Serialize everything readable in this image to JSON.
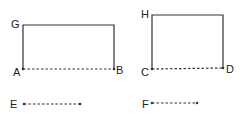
{
  "diagram": {
    "colors": {
      "line": "#333333",
      "label": "#222222",
      "background": "#ffffff"
    },
    "left_figure": {
      "labels": {
        "top_left": "G",
        "bottom_left": "A",
        "bottom_right": "B"
      },
      "solid_edges": [
        "G-top-right",
        "G-A",
        "top-right-B"
      ],
      "dashed_edges": [
        "A-B"
      ]
    },
    "right_figure": {
      "labels": {
        "top_left": "H",
        "bottom_left": "C",
        "bottom_right": "D"
      },
      "solid_edges": [
        "H-top-right",
        "H-C",
        "top-right-D"
      ],
      "dashed_edges": [
        "C-D"
      ]
    },
    "segments": [
      {
        "label": "E",
        "style": "dashed"
      },
      {
        "label": "F",
        "style": "dashed"
      }
    ]
  }
}
